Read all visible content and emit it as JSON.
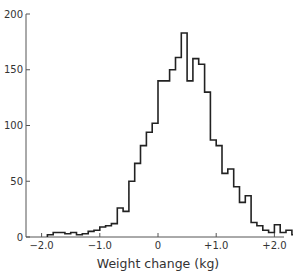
{
  "chart_data": {
    "type": "bar",
    "subtype": "histogram-step",
    "title": "",
    "xlabel": "Weight change (kg)",
    "ylabel": "",
    "xlim": [
      -2.1,
      2.5
    ],
    "ylim": [
      0,
      200
    ],
    "grid": false,
    "legend": null,
    "bin_width": 0.1,
    "x_ticks": [
      -2.0,
      -1.0,
      0,
      1.0,
      2.0
    ],
    "x_tick_labels": [
      "−2.0",
      "−1.0",
      "0",
      "+1.0",
      "+2.0"
    ],
    "y_ticks": [
      0,
      50,
      100,
      150,
      200
    ],
    "y_tick_labels": [
      "0",
      "50",
      "100",
      "150",
      "200"
    ],
    "bin_edges": [
      -1.9,
      -1.8,
      -1.7,
      -1.6,
      -1.5,
      -1.4,
      -1.3,
      -1.2,
      -1.1,
      -1.0,
      -0.9,
      -0.8,
      -0.7,
      -0.6,
      -0.5,
      -0.4,
      -0.3,
      -0.2,
      -0.1,
      0.0,
      0.1,
      0.2,
      0.3,
      0.4,
      0.5,
      0.6,
      0.7,
      0.8,
      0.9,
      1.0,
      1.1,
      1.2,
      1.3,
      1.4,
      1.5,
      1.6,
      1.7,
      1.8,
      1.9,
      2.0,
      2.1,
      2.2,
      2.3,
      2.4
    ],
    "values": [
      2,
      4,
      4,
      3,
      4,
      2,
      3,
      5,
      6,
      9,
      10,
      12,
      26,
      23,
      50,
      66,
      82,
      94,
      102,
      140,
      140,
      150,
      161,
      183,
      140,
      160,
      155,
      130,
      87,
      82,
      57,
      61,
      45,
      31,
      37,
      13,
      10,
      6,
      4,
      11,
      4,
      6,
      2,
      3
    ],
    "color": "#222222"
  }
}
